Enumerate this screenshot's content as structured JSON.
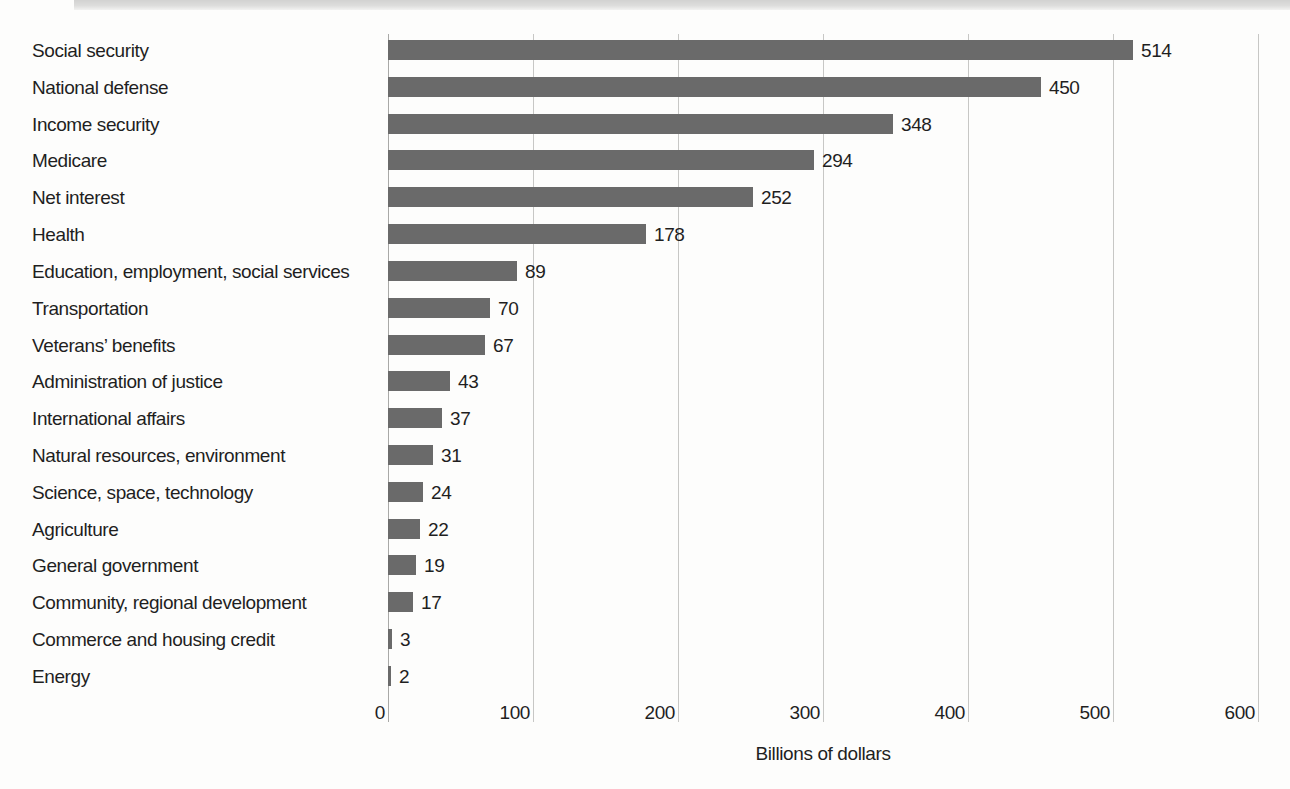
{
  "chart_data": {
    "type": "bar",
    "orientation": "horizontal",
    "title": "",
    "xlabel": "Billions of dollars",
    "ylabel": "",
    "xlim": [
      0,
      600
    ],
    "xticks": [
      0,
      100,
      200,
      300,
      400,
      500,
      600
    ],
    "grid": true,
    "legend": "none",
    "categories": [
      "Social security",
      "National defense",
      "Income security",
      "Medicare",
      "Net interest",
      "Health",
      "Education, employment, social services",
      "Transportation",
      "Veterans’ benefits",
      "Administration of justice",
      "International affairs",
      "Natural resources, environment",
      "Science, space, technology",
      "Agriculture",
      "General government",
      "Community, regional development",
      "Commerce and housing credit",
      "Energy"
    ],
    "values": [
      514,
      450,
      348,
      294,
      252,
      178,
      89,
      70,
      67,
      43,
      37,
      31,
      24,
      22,
      19,
      17,
      3,
      2
    ]
  },
  "colors": {
    "bar": "#6a6a6a",
    "gridline": "#c7c7c5",
    "axis_line": "#a9a9a7",
    "text": "#1f1f1f",
    "scan_band": "#d7d7d6"
  }
}
